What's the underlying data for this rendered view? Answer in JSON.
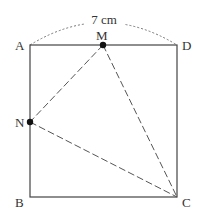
{
  "diagram": {
    "dimension_label": "7 cm",
    "side_length_cm": 7,
    "colors": {
      "stroke": "#444444",
      "dashed": "#555555",
      "text": "#333333",
      "dot": "#111111"
    },
    "points": {
      "A": {
        "label": "A",
        "x": 30,
        "y": 45
      },
      "D": {
        "label": "D",
        "x": 177,
        "y": 45
      },
      "B": {
        "label": "B",
        "x": 30,
        "y": 197
      },
      "C": {
        "label": "C",
        "x": 177,
        "y": 197
      },
      "M": {
        "label": "M",
        "x": 103,
        "y": 45
      },
      "N": {
        "label": "N",
        "x": 30,
        "y": 122
      }
    },
    "segments_solid": [
      "AB",
      "BC",
      "CD",
      "DA"
    ],
    "segments_dashed": [
      "MN",
      "MC",
      "NC"
    ],
    "arc_dotted": "A to D with label 7 cm"
  }
}
